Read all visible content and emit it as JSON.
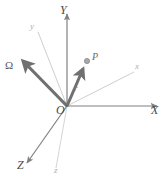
{
  "figure": {
    "type": "vector-diagram",
    "background_color": "#ffffff",
    "width": 166,
    "height": 182
  },
  "colors": {
    "fixed_axis": "#808080",
    "rotating_axis": "#c8c8c8",
    "vector": "#707070",
    "label_major": "#4a4a4a",
    "label_minor": "#b0b0b0",
    "point_fill": "#a8a8a8"
  },
  "origin": {
    "label": "O",
    "x": 67,
    "y": 106
  },
  "fixed_axes": [
    {
      "name": "y-axis-fixed",
      "label": "Y",
      "label_x": 62,
      "label_y": 6,
      "x1": 67,
      "y1": 106,
      "x2": 67,
      "y2": 12,
      "arrow": true
    },
    {
      "name": "x-axis-fixed",
      "label": "X",
      "label_x": 152,
      "label_y": 110,
      "x1": 67,
      "y1": 106,
      "x2": 160,
      "y2": 106,
      "arrow": true
    },
    {
      "name": "z-axis-fixed",
      "label": "Z",
      "label_x": 18,
      "label_y": 161,
      "x1": 67,
      "y1": 106,
      "x2": 25,
      "y2": 166,
      "arrow": true
    }
  ],
  "rotating_axes": [
    {
      "name": "y-axis-rotating",
      "label": "y",
      "label_x": 30,
      "label_y": 23,
      "x1": 67,
      "y1": 106,
      "x2": 38,
      "y2": 32,
      "arrow": false
    },
    {
      "name": "x-axis-rotating",
      "label": "x",
      "label_x": 136,
      "label_y": 65,
      "x1": 67,
      "y1": 106,
      "x2": 134,
      "y2": 72,
      "arrow": false
    },
    {
      "name": "z-axis-rotating",
      "label": "z",
      "label_x": 55,
      "label_y": 167,
      "x1": 67,
      "y1": 106,
      "x2": 56,
      "y2": 168,
      "arrow": false
    }
  ],
  "vectors": [
    {
      "name": "omega-vector",
      "label": "Ω",
      "label_x": 7,
      "label_y": 63,
      "x1": 67,
      "y1": 106,
      "x2": 20,
      "y2": 58,
      "thick": true
    },
    {
      "name": "position-vector-r",
      "label": "r",
      "label_x": 74,
      "label_y": 86,
      "x1": 67,
      "y1": 106,
      "x2": 84,
      "y2": 66,
      "thick": true
    }
  ],
  "points": [
    {
      "name": "point-p",
      "label": "P",
      "cx": 87,
      "cy": 61,
      "r": 2.6,
      "label_x": 92,
      "label_y": 54
    }
  ]
}
